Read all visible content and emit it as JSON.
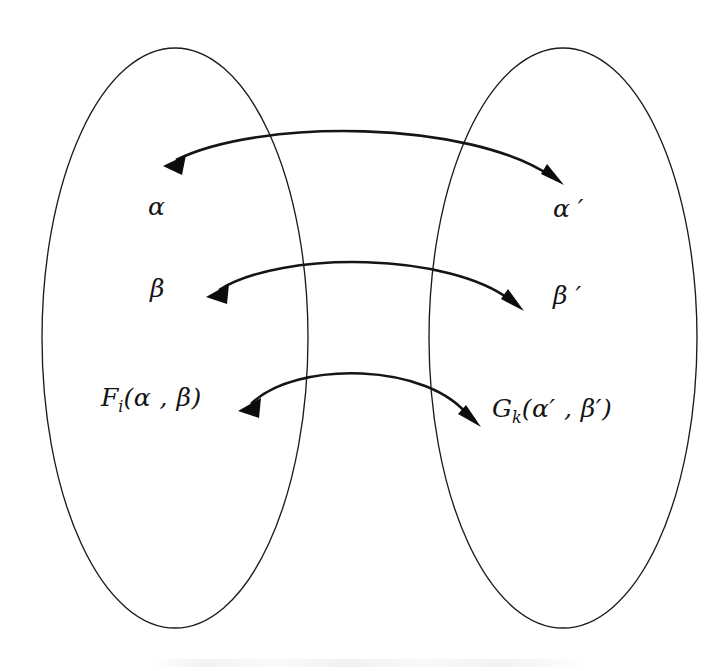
{
  "figure": {
    "type": "set-correspondence-diagram",
    "background_color": "#ffffff",
    "ink_color": "#141414",
    "sets": [
      {
        "id": "left-set",
        "name": "left-oval",
        "shape": "ellipse",
        "cx": 175,
        "cy": 338,
        "rx": 133,
        "ry": 290
      },
      {
        "id": "right-set",
        "name": "right-oval",
        "shape": "ellipse",
        "cx": 563,
        "cy": 338,
        "rx": 134,
        "ry": 290
      }
    ],
    "labels": {
      "alpha": "α",
      "alpha_prime": "α ′",
      "beta": "β",
      "beta_prime": "β ′",
      "f_base": "F",
      "f_sub": "i",
      "f_args": "(α , β)",
      "g_base": "G",
      "g_sub": "k",
      "g_args": "(α′ , β′)"
    },
    "arrows": [
      {
        "id": "arrow-alpha",
        "name": "double-arrow-alpha",
        "kind": "double-headed-arc",
        "from": "α",
        "to": "α ′",
        "left_tip": [
          165,
          166
        ],
        "right_tip": [
          561,
          183
        ],
        "apex": [
          365,
          124
        ]
      },
      {
        "id": "arrow-beta",
        "name": "double-arrow-beta",
        "kind": "double-headed-arc",
        "from": "β",
        "to": "β ′",
        "left_tip": [
          208,
          296
        ],
        "right_tip": [
          521,
          308
        ],
        "apex": [
          365,
          253
        ]
      },
      {
        "id": "arrow-function",
        "name": "double-arrow-function",
        "kind": "double-headed-arc",
        "from": "F_i(α , β)",
        "to": "G_k(α′ , β′)",
        "left_tip": [
          240,
          410
        ],
        "right_tip": [
          478,
          424
        ],
        "apex": [
          358,
          363
        ]
      }
    ]
  }
}
